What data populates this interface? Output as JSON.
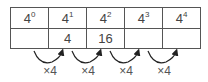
{
  "table": {
    "headers": [
      {
        "base": "4",
        "exp": "0"
      },
      {
        "base": "4",
        "exp": "1"
      },
      {
        "base": "4",
        "exp": "2"
      },
      {
        "base": "4",
        "exp": "3"
      },
      {
        "base": "4",
        "exp": "4"
      }
    ],
    "values": [
      "",
      "4",
      "16",
      "",
      ""
    ]
  },
  "arrows": [
    {
      "label": "×4"
    },
    {
      "label": "×4"
    },
    {
      "label": "×4"
    },
    {
      "label": "×4"
    }
  ]
}
